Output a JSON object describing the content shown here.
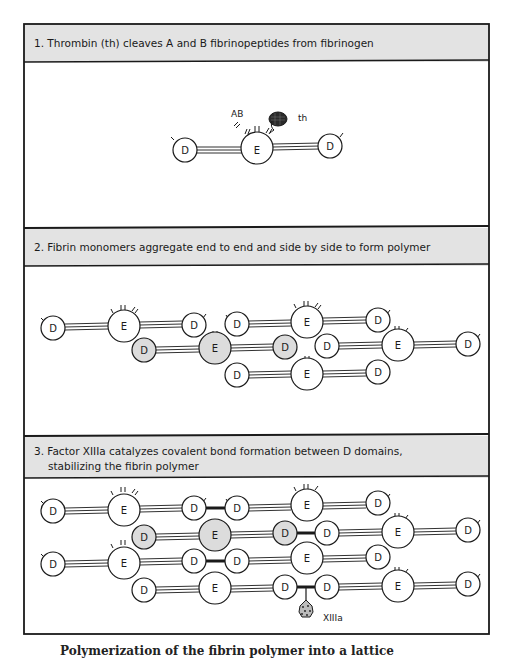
{
  "figure": {
    "panels": [
      {
        "step": "1",
        "title": "1. Thrombin (th) cleaves A and B fibrinopeptides from fibrinogen",
        "labels": {
          "fibrinopeptides": "AB",
          "thrombin": "th"
        }
      },
      {
        "step": "2",
        "title": "2. Fibrin monomers aggregate end to end and side by side to form polymer"
      },
      {
        "step": "3",
        "title_line1": "3. Factor XIIIa catalyzes covalent bond formation between D domains,",
        "title_line2": "stabilizing the fibrin polymer",
        "labels": {
          "enzyme": "XIIIa"
        }
      }
    ],
    "node_labels": {
      "d_domain": "D",
      "e_domain": "E"
    },
    "colors": {
      "header_band": "#e3e3e3",
      "border": "#1a1a1a",
      "node_fill": "#ffffff",
      "shaded_node_fill": "#dcdcdc",
      "enzyme_fill": "#2a2a2a"
    },
    "caption": "Polymerization of the fibrin polymer into a lattice"
  }
}
